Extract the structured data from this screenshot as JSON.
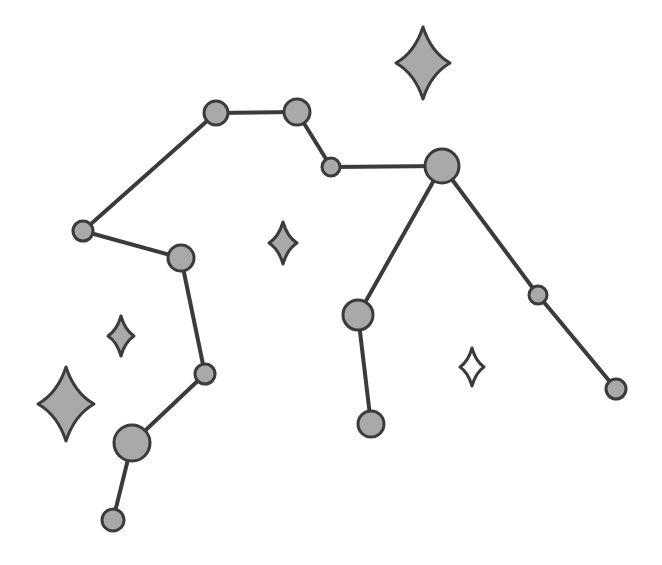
{
  "diagram": {
    "type": "constellation-line-diagram",
    "canvas": {
      "width": 662,
      "height": 565,
      "background": "#ffffff"
    },
    "style": {
      "node_fill": "#a9a9a9",
      "node_stroke": "#3b3b3b",
      "node_stroke_width": 3,
      "edge_stroke": "#3b3b3b",
      "edge_stroke_width": 4,
      "sparkle_fill": "#a9a9a9",
      "sparkle_stroke": "#3b3b3b",
      "sparkle_stroke_width": 3,
      "sparkle_hollow_fill": "#ffffff"
    },
    "nodes": [
      {
        "id": "n1",
        "name": "star-node-upper-left-bend",
        "x": 216,
        "y": 113,
        "r": 12,
        "magnitude": "medium"
      },
      {
        "id": "n2",
        "name": "star-node-upper-right-bend",
        "x": 297,
        "y": 112,
        "r": 13,
        "magnitude": "medium"
      },
      {
        "id": "n3",
        "name": "star-node-small-link",
        "x": 331,
        "y": 167,
        "r": 9,
        "magnitude": "small"
      },
      {
        "id": "n4",
        "name": "star-node-hub-bright",
        "x": 442,
        "y": 166,
        "r": 17,
        "magnitude": "bright"
      },
      {
        "id": "n5",
        "name": "star-node-west-joint",
        "x": 83,
        "y": 231,
        "r": 10,
        "magnitude": "small"
      },
      {
        "id": "n6",
        "name": "star-node-west-elbow",
        "x": 181,
        "y": 258,
        "r": 13,
        "magnitude": "medium"
      },
      {
        "id": "n7",
        "name": "star-node-lower-west-small",
        "x": 205,
        "y": 374,
        "r": 10,
        "magnitude": "small"
      },
      {
        "id": "n8",
        "name": "star-node-lower-left-bright",
        "x": 132,
        "y": 443,
        "r": 18,
        "magnitude": "bright"
      },
      {
        "id": "n9",
        "name": "star-node-bottom-left-tip",
        "x": 113,
        "y": 520,
        "r": 11,
        "magnitude": "small"
      },
      {
        "id": "n10",
        "name": "star-node-center-lower",
        "x": 358,
        "y": 315,
        "r": 15,
        "magnitude": "medium"
      },
      {
        "id": "n11",
        "name": "star-node-bottom-center-tip",
        "x": 371,
        "y": 424,
        "r": 13,
        "magnitude": "medium"
      },
      {
        "id": "n12",
        "name": "star-node-east-mid",
        "x": 538,
        "y": 295,
        "r": 9,
        "magnitude": "small"
      },
      {
        "id": "n13",
        "name": "star-node-east-tip",
        "x": 616,
        "y": 389,
        "r": 10,
        "magnitude": "small"
      }
    ],
    "edges": [
      {
        "id": "e1",
        "name": "edge-west-joint-to-upper-left",
        "from": "n5",
        "to": "n1",
        "x1": 83,
        "y1": 231,
        "x2": 216,
        "y2": 113
      },
      {
        "id": "e2",
        "name": "edge-upper-left-to-upper-right",
        "from": "n1",
        "to": "n2",
        "x1": 216,
        "y1": 113,
        "x2": 297,
        "y2": 112
      },
      {
        "id": "e3",
        "name": "edge-upper-right-to-small-link",
        "from": "n2",
        "to": "n3",
        "x1": 297,
        "y1": 112,
        "x2": 331,
        "y2": 167
      },
      {
        "id": "e4",
        "name": "edge-small-link-to-hub",
        "from": "n3",
        "to": "n4",
        "x1": 331,
        "y1": 167,
        "x2": 442,
        "y2": 166
      },
      {
        "id": "e5",
        "name": "edge-west-joint-to-west-elbow",
        "from": "n5",
        "to": "n6",
        "x1": 83,
        "y1": 231,
        "x2": 181,
        "y2": 258
      },
      {
        "id": "e6",
        "name": "edge-west-elbow-to-lower-small",
        "from": "n6",
        "to": "n7",
        "x1": 181,
        "y1": 258,
        "x2": 205,
        "y2": 374
      },
      {
        "id": "e7",
        "name": "edge-lower-small-to-lower-left",
        "from": "n7",
        "to": "n8",
        "x1": 205,
        "y1": 374,
        "x2": 132,
        "y2": 443
      },
      {
        "id": "e8",
        "name": "edge-lower-left-to-bottom-tip",
        "from": "n8",
        "to": "n9",
        "x1": 132,
        "y1": 443,
        "x2": 113,
        "y2": 520
      },
      {
        "id": "e9",
        "name": "edge-hub-to-center-lower",
        "from": "n4",
        "to": "n10",
        "x1": 442,
        "y1": 166,
        "x2": 358,
        "y2": 315
      },
      {
        "id": "e10",
        "name": "edge-center-lower-to-bottom-tip",
        "from": "n10",
        "to": "n11",
        "x1": 358,
        "y1": 315,
        "x2": 371,
        "y2": 424
      },
      {
        "id": "e11",
        "name": "edge-hub-to-east-mid",
        "from": "n4",
        "to": "n12",
        "x1": 442,
        "y1": 166,
        "x2": 538,
        "y2": 295
      },
      {
        "id": "e12",
        "name": "edge-east-mid-to-east-tip",
        "from": "n12",
        "to": "n13",
        "x1": 538,
        "y1": 295,
        "x2": 616,
        "y2": 389
      }
    ],
    "sparkles": [
      {
        "id": "s1",
        "name": "sparkle-top-right-large",
        "cx": 423,
        "cy": 63,
        "rx": 27,
        "ry": 36,
        "filled": true
      },
      {
        "id": "s2",
        "name": "sparkle-left-large",
        "cx": 66,
        "cy": 404,
        "rx": 28,
        "ry": 37,
        "filled": true
      },
      {
        "id": "s3",
        "name": "sparkle-center-small",
        "cx": 283,
        "cy": 243,
        "rx": 14,
        "ry": 21,
        "filled": true
      },
      {
        "id": "s4",
        "name": "sparkle-left-small",
        "cx": 121,
        "cy": 336,
        "rx": 13,
        "ry": 20,
        "filled": true
      },
      {
        "id": "s5",
        "name": "sparkle-lower-right-open",
        "cx": 472,
        "cy": 367,
        "rx": 12,
        "ry": 19,
        "filled": false
      }
    ]
  }
}
